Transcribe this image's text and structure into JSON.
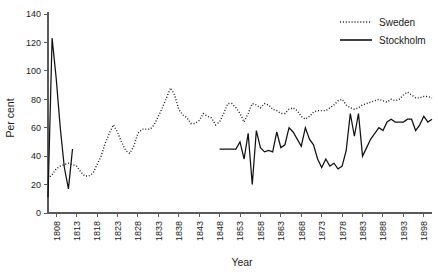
{
  "chart_data": {
    "type": "line",
    "title": "",
    "xlabel": "Year",
    "ylabel": "Per cent",
    "xlim": [
      1806,
      1900
    ],
    "ylim": [
      0,
      140
    ],
    "grid": false,
    "legend_position": "top-right",
    "xticks": [
      1808,
      1813,
      1818,
      1823,
      1828,
      1833,
      1838,
      1843,
      1848,
      1853,
      1858,
      1863,
      1868,
      1873,
      1878,
      1883,
      1888,
      1893,
      1898
    ],
    "yticks": [
      0,
      20,
      40,
      60,
      80,
      100,
      120,
      140
    ],
    "series": [
      {
        "name": "Sweden",
        "style": "dotted",
        "x": [
          1806,
          1807,
          1808,
          1809,
          1810,
          1811,
          1812,
          1813,
          1814,
          1815,
          1816,
          1817,
          1818,
          1819,
          1820,
          1821,
          1822,
          1823,
          1824,
          1825,
          1826,
          1827,
          1828,
          1829,
          1830,
          1831,
          1832,
          1833,
          1834,
          1835,
          1836,
          1837,
          1838,
          1839,
          1840,
          1841,
          1842,
          1843,
          1844,
          1845,
          1846,
          1847,
          1848,
          1849,
          1850,
          1851,
          1852,
          1853,
          1854,
          1855,
          1856,
          1857,
          1858,
          1859,
          1860,
          1861,
          1862,
          1863,
          1864,
          1865,
          1866,
          1867,
          1868,
          1869,
          1870,
          1871,
          1872,
          1873,
          1874,
          1875,
          1876,
          1877,
          1878,
          1879,
          1880,
          1881,
          1882,
          1883,
          1884,
          1885,
          1886,
          1887,
          1888,
          1889,
          1890,
          1891,
          1892,
          1893,
          1894,
          1895,
          1896,
          1897,
          1898,
          1899,
          1900
        ],
        "values": [
          24,
          27,
          31,
          33,
          34,
          35,
          34,
          33,
          29,
          26,
          26,
          28,
          34,
          40,
          49,
          56,
          62,
          57,
          50,
          44,
          42,
          47,
          56,
          59,
          59,
          59,
          62,
          68,
          74,
          81,
          88,
          83,
          73,
          69,
          67,
          63,
          63,
          65,
          70,
          68,
          67,
          62,
          64,
          70,
          77,
          77,
          74,
          70,
          64,
          70,
          77,
          76,
          74,
          77,
          76,
          73,
          72,
          70,
          70,
          73,
          74,
          72,
          68,
          66,
          68,
          71,
          72,
          72,
          72,
          74,
          76,
          79,
          80,
          76,
          74,
          73,
          74,
          76,
          77,
          78,
          79,
          80,
          79,
          78,
          80,
          79,
          80,
          83,
          85,
          83,
          81,
          81,
          82,
          82,
          81
        ]
      },
      {
        "name": "Stockholm",
        "style": "solid",
        "x": [
          1806,
          1807,
          1808,
          1809,
          1810,
          1811,
          1812,
          1848,
          1849,
          1850,
          1851,
          1852,
          1853,
          1854,
          1855,
          1856,
          1857,
          1858,
          1859,
          1860,
          1861,
          1862,
          1863,
          1864,
          1865,
          1866,
          1867,
          1868,
          1869,
          1870,
          1871,
          1872,
          1873,
          1874,
          1875,
          1876,
          1877,
          1878,
          1879,
          1880,
          1881,
          1882,
          1883,
          1884,
          1885,
          1886,
          1887,
          1888,
          1889,
          1890,
          1891,
          1892,
          1893,
          1894,
          1895,
          1896,
          1897,
          1898,
          1899,
          1900
        ],
        "values": [
          11,
          123,
          95,
          60,
          32,
          17,
          45,
          45,
          45,
          45,
          45,
          45,
          50,
          38,
          56,
          20,
          58,
          46,
          43,
          44,
          43,
          57,
          46,
          48,
          60,
          57,
          52,
          47,
          60,
          52,
          48,
          38,
          32,
          38,
          33,
          35,
          31,
          33,
          44,
          70,
          54,
          70,
          40,
          46,
          52,
          56,
          60,
          58,
          64,
          66,
          64,
          64,
          64,
          66,
          66,
          58,
          62,
          68,
          64,
          66
        ]
      }
    ]
  },
  "legend": {
    "items": [
      {
        "label": "Sweden",
        "style": "dotted"
      },
      {
        "label": "Stockholm",
        "style": "solid"
      }
    ]
  }
}
